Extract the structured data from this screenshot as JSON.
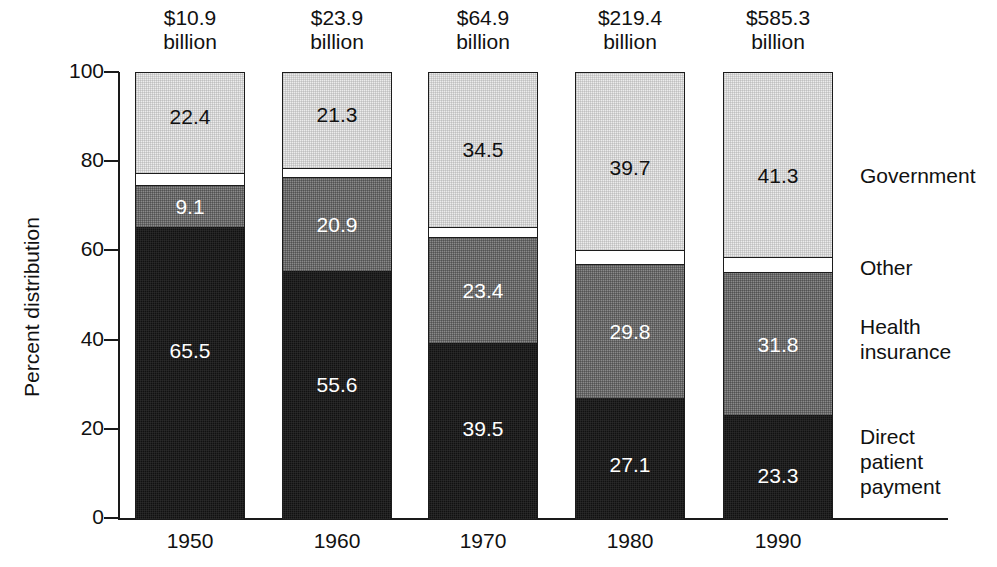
{
  "chart_data": {
    "type": "bar",
    "subtype": "stacked-percent",
    "title": "",
    "xlabel": "",
    "ylabel": "Percent distribution",
    "ylim": [
      0,
      100
    ],
    "yticks": [
      0,
      20,
      40,
      60,
      80,
      100
    ],
    "ytick_labels": [
      "0",
      "20",
      "40",
      "60",
      "80",
      "100"
    ],
    "grid": false,
    "legend_position": "right",
    "categories": [
      "1950",
      "1960",
      "1970",
      "1980",
      "1990"
    ],
    "category_totals": [
      "$10.9\nbillion",
      "$23.9\nbillion",
      "$64.9\nbillion",
      "$219.4\nbillion",
      "$585.3\nbillion"
    ],
    "series": [
      {
        "name": "Government",
        "color": "#ececec",
        "label_color": "#111111",
        "values": [
          22.4,
          21.3,
          34.5,
          39.7,
          41.3
        ],
        "labels": [
          "22.4",
          "21.3",
          "34.5",
          "39.7",
          "41.3"
        ]
      },
      {
        "name": "Other",
        "color": "#ffffff",
        "label_color": "#111111",
        "values": [
          3.0,
          2.2,
          2.6,
          3.4,
          3.6
        ],
        "labels": [
          "",
          "",
          "",
          "",
          ""
        ]
      },
      {
        "name": "Health insurance",
        "color": "#8a8a8a",
        "label_color": "#ffffff",
        "values": [
          9.1,
          20.9,
          23.4,
          29.8,
          31.8
        ],
        "labels": [
          "9.1",
          "20.9",
          "23.4",
          "29.8",
          "31.8"
        ]
      },
      {
        "name": "Direct patient payment",
        "color": "#111111",
        "label_color": "#ffffff",
        "values": [
          65.5,
          55.6,
          39.5,
          27.1,
          23.3
        ],
        "labels": [
          "65.5",
          "55.6",
          "39.5",
          "27.1",
          "23.3"
        ]
      }
    ]
  },
  "axis": {
    "y_title": "Percent distribution",
    "y_ticks": [
      "100",
      "80",
      "60",
      "40",
      "20",
      "0"
    ],
    "x_ticks": [
      "1950",
      "1960",
      "1970",
      "1980",
      "1990"
    ]
  },
  "bar_totals": [
    {
      "amount": "$10.9",
      "unit": "billion"
    },
    {
      "amount": "$23.9",
      "unit": "billion"
    },
    {
      "amount": "$64.9",
      "unit": "billion"
    },
    {
      "amount": "$219.4",
      "unit": "billion"
    },
    {
      "amount": "$585.3",
      "unit": "billion"
    }
  ],
  "legend": {
    "entries": [
      {
        "label": "Government",
        "color": "#ececec"
      },
      {
        "label": "Other",
        "color": "#ffffff"
      },
      {
        "label": "Health\ninsurance",
        "color": "#8a8a8a"
      },
      {
        "label": "Direct\npatient\npayment",
        "color": "#111111"
      }
    ],
    "line1": "Government",
    "line2": "Other",
    "line3a": "Health",
    "line3b": "insurance",
    "line4a": "Direct",
    "line4b": "patient",
    "line4c": "payment"
  },
  "bars": [
    {
      "year": "1950",
      "total_amount": "$10.9",
      "total_unit": "billion",
      "government": "22.4",
      "other": "",
      "health": "9.1",
      "direct": "65.5"
    },
    {
      "year": "1960",
      "total_amount": "$23.9",
      "total_unit": "billion",
      "government": "21.3",
      "other": "",
      "health": "20.9",
      "direct": "55.6"
    },
    {
      "year": "1970",
      "total_amount": "$64.9",
      "total_unit": "billion",
      "government": "34.5",
      "other": "",
      "health": "23.4",
      "direct": "39.5"
    },
    {
      "year": "1980",
      "total_amount": "$219.4",
      "total_unit": "billion",
      "government": "39.7",
      "other": "",
      "health": "29.8",
      "direct": "27.1"
    },
    {
      "year": "1990",
      "total_amount": "$585.3",
      "total_unit": "billion",
      "government": "41.3",
      "other": "",
      "health": "31.8",
      "direct": "23.3"
    }
  ]
}
